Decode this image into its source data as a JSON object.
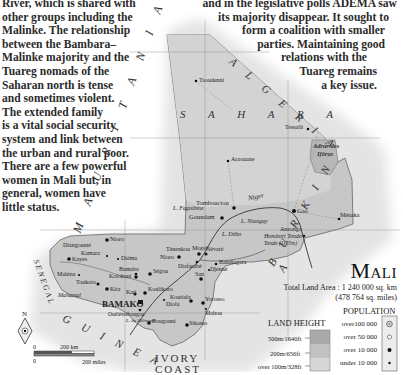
{
  "left_paragraph": [
    "River, which is shared with",
    "other groups including the",
    "Malinke. The relationship",
    "between the Bambara–",
    "Malinke majority and the",
    "Tuareg nomads of the",
    "Saharan north is tense",
    "and sometimes violent.",
    "The extended family",
    "is a vital social security",
    "system and link between",
    "the urban and rural poor.",
    "There are a few powerful",
    "women in Mali but, in",
    "general, women have",
    "little status."
  ],
  "right_paragraph": [
    "and in the legislative polls ADEMA saw",
    "its majority disappear. It sought to",
    "form a coalition with smaller",
    "parties. Maintaining good",
    "relations with the",
    "Tuareg remains",
    "a key issue."
  ],
  "map": {
    "title": "Mali",
    "total_land_area": "Total Land Area : 1 240 000 sq. km",
    "total_land_area_miles": "(478 764 sq. miles)",
    "countries": {
      "algeria": "A L G E R I A",
      "mauritania": "M A U R I T A N I A",
      "senegal": "SENEGAL",
      "guinea": "G U I N E A",
      "ivory_coast_1": "IVORY",
      "ivory_coast_2": "COAST",
      "burkina": "B U R K I N A",
      "niger": "N"
    },
    "regions": {
      "sahara": "S A H A R A",
      "adrar_1": "Adrar des",
      "adrar_2": "Ifôras"
    },
    "rivers": {
      "niger": "Niger",
      "faguibine": "L. Faguibine",
      "niangay": "L. Niangay",
      "debo": "L. Débo",
      "selingue": "L. de Sélingué"
    },
    "peak": {
      "name": "Hombori Tondo",
      "elevation": "Tondo (1155m)"
    },
    "cities": [
      {
        "name": "Taoudenni",
        "x": 196,
        "y": 81,
        "size": "small"
      },
      {
        "name": "Araouane",
        "x": 228,
        "y": 161,
        "size": "small"
      },
      {
        "name": "Tessalit",
        "x": 308,
        "y": 129,
        "size": "small"
      },
      {
        "name": "Tombouctou",
        "x": 234,
        "y": 208,
        "size": "medium"
      },
      {
        "name": "Goundam",
        "x": 222,
        "y": 218,
        "size": "medium"
      },
      {
        "name": "Gao",
        "x": 294,
        "y": 211,
        "size": "medium"
      },
      {
        "name": "Ménaka",
        "x": 339,
        "y": 219,
        "size": "small"
      },
      {
        "name": "Ansongo",
        "x": 304,
        "y": 236,
        "size": "small"
      },
      {
        "name": "Nioro",
        "x": 107,
        "y": 240,
        "size": "medium"
      },
      {
        "name": "Diangounté",
        "x": 95,
        "y": 247,
        "size": "small"
      },
      {
        "name": "Kamara",
        "x": 105,
        "y": 256,
        "size": "small"
      },
      {
        "name": "Kayes",
        "x": 69,
        "y": 259,
        "size": "medium"
      },
      {
        "name": "Diéma",
        "x": 118,
        "y": 259,
        "size": "small"
      },
      {
        "name": "Ténenkou",
        "x": 175,
        "y": 252,
        "size": "small"
      },
      {
        "name": "Nioro",
        "x": 176,
        "y": 257,
        "size": "small"
      },
      {
        "name": "Mopti",
        "x": 199,
        "y": 254,
        "size": "medium"
      },
      {
        "name": "Sévaré",
        "x": 204,
        "y": 253,
        "size": "small"
      },
      {
        "name": "Bandiagara",
        "x": 215,
        "y": 264,
        "size": "small"
      },
      {
        "name": "Diafarabé",
        "x": 196,
        "y": 262,
        "size": "small"
      },
      {
        "name": "Djenné",
        "x": 208,
        "y": 270,
        "size": "small"
      },
      {
        "name": "San",
        "x": 201,
        "y": 279,
        "size": "medium"
      },
      {
        "name": "Bamaba",
        "x": 137,
        "y": 272,
        "size": "small"
      },
      {
        "name": "Ségou",
        "x": 150,
        "y": 274,
        "size": "medium"
      },
      {
        "name": "Mahina",
        "x": 78,
        "y": 275,
        "size": "small"
      },
      {
        "name": "Kolokani",
        "x": 136,
        "y": 276,
        "size": "small"
      },
      {
        "name": "Toukoto",
        "x": 98,
        "y": 282,
        "size": "small"
      },
      {
        "name": "Kita",
        "x": 107,
        "y": 289,
        "size": "medium"
      },
      {
        "name": "Kati",
        "x": 135,
        "y": 293,
        "size": "small"
      },
      {
        "name": "Koulikoro",
        "x": 145,
        "y": 293,
        "size": "medium"
      },
      {
        "name": "Koutiala",
        "x": 191,
        "y": 301,
        "size": "medium"
      },
      {
        "name": "Diola",
        "x": 163,
        "y": 300,
        "size": "small"
      },
      {
        "name": "Yorosso",
        "x": 203,
        "y": 303,
        "size": "small"
      },
      {
        "name": "Mahou",
        "x": 205,
        "y": 309,
        "size": "small"
      },
      {
        "name": "BAMAKO",
        "x": 140,
        "y": 302,
        "size": "capital"
      },
      {
        "name": "Ouéléssébougou",
        "x": 140,
        "y": 313,
        "size": "small"
      },
      {
        "name": "Bougouni",
        "x": 149,
        "y": 323,
        "size": "medium"
      },
      {
        "name": "Sikasso",
        "x": 187,
        "y": 325,
        "size": "medium"
      },
      {
        "name": "Mahamal",
        "x": 62,
        "y": 285,
        "size": "small"
      }
    ],
    "compass": {
      "label": "N"
    },
    "scale": {
      "km_zero": "0",
      "km_label": "200 km",
      "miles_zero": "0",
      "miles_label": "200 miles"
    },
    "land_height": {
      "title": "LAND HEIGHT",
      "levels": [
        "500m/1640ft",
        "200m/656ft",
        "over 100m/328ft"
      ],
      "colors": [
        "#a9a9a9",
        "#c2c2c2",
        "#d6d6d6"
      ]
    },
    "population": {
      "title": "POPULATION",
      "levels": [
        "over100 000",
        "over 50 000",
        "over 10 000",
        "under 10 000"
      ]
    }
  }
}
